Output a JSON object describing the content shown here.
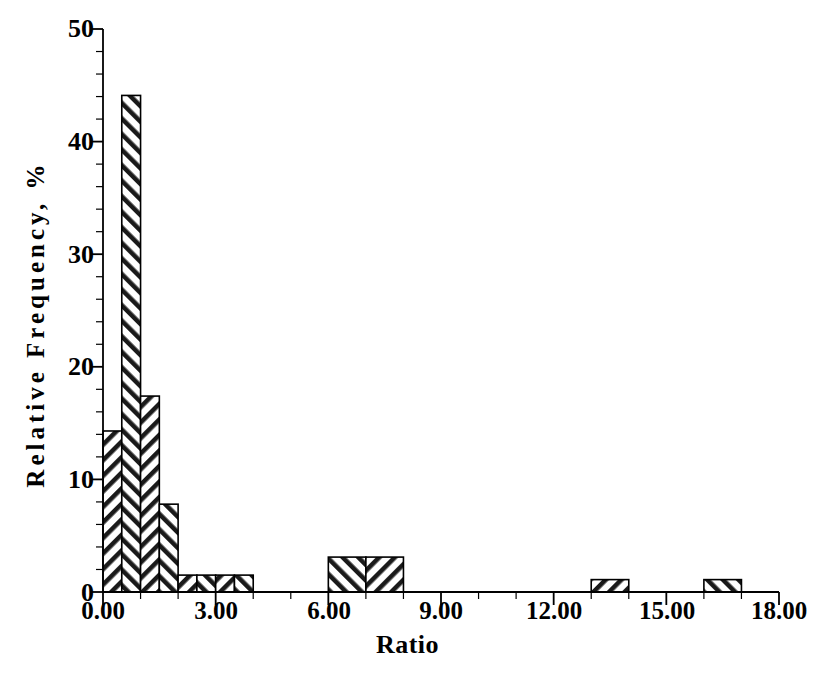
{
  "chart_data": {
    "type": "bar",
    "title": "",
    "subtitle": "",
    "xlabel": "Ratio",
    "ylabel": "Relative Frequency, %",
    "xlim": [
      0.0,
      18.0
    ],
    "ylim": [
      0,
      50
    ],
    "grid": false,
    "legend": null,
    "bin_width": 0.5,
    "x_major_ticks": [
      0.0,
      3.0,
      6.0,
      9.0,
      12.0,
      15.0,
      18.0
    ],
    "x_major_tick_labels": [
      "0.00",
      "3.00",
      "6.00",
      "9.00",
      "12.00",
      "15.00",
      "18.00"
    ],
    "x_minor_tick_step": 1.0,
    "y_major_ticks": [
      0,
      10,
      20,
      30,
      40,
      50
    ],
    "y_major_tick_labels": [
      "0",
      "10",
      "20",
      "30",
      "40",
      "50"
    ],
    "y_minor_tick_step": 2,
    "bars": [
      {
        "x_start": 0.0,
        "x_end": 0.5,
        "value": 14.3,
        "hatch": "forward"
      },
      {
        "x_start": 0.5,
        "x_end": 1.0,
        "value": 44.1,
        "hatch": "backward"
      },
      {
        "x_start": 1.0,
        "x_end": 1.5,
        "value": 17.4,
        "hatch": "forward"
      },
      {
        "x_start": 1.5,
        "x_end": 2.0,
        "value": 7.8,
        "hatch": "backward"
      },
      {
        "x_start": 2.0,
        "x_end": 2.5,
        "value": 1.5,
        "hatch": "forward"
      },
      {
        "x_start": 2.5,
        "x_end": 3.0,
        "value": 1.5,
        "hatch": "backward"
      },
      {
        "x_start": 3.0,
        "x_end": 3.5,
        "value": 1.5,
        "hatch": "forward"
      },
      {
        "x_start": 3.5,
        "x_end": 4.0,
        "value": 1.5,
        "hatch": "backward"
      },
      {
        "x_start": 6.0,
        "x_end": 7.0,
        "value": 3.1,
        "hatch": "backward"
      },
      {
        "x_start": 7.0,
        "x_end": 8.0,
        "value": 3.1,
        "hatch": "forward"
      },
      {
        "x_start": 13.0,
        "x_end": 14.0,
        "value": 1.1,
        "hatch": "forward"
      },
      {
        "x_start": 16.0,
        "x_end": 17.0,
        "value": 1.1,
        "hatch": "backward"
      }
    ],
    "categories": [
      "0.00-0.50",
      "0.50-1.00",
      "1.00-1.50",
      "1.50-2.00",
      "2.00-2.50",
      "2.50-3.00",
      "3.00-3.50",
      "3.50-4.00",
      "6.00-7.00",
      "7.00-8.00",
      "13.00-14.00",
      "16.00-17.00"
    ],
    "values": [
      14.3,
      44.1,
      17.4,
      7.8,
      1.5,
      1.5,
      1.5,
      1.5,
      3.1,
      3.1,
      1.1,
      1.1
    ]
  },
  "axes": {
    "ylabel": "Relative Frequency, %",
    "xlabel": "Ratio",
    "ytick_labels": [
      "50",
      "40",
      "30",
      "20",
      "10",
      "0"
    ],
    "xtick_labels": [
      "0.00",
      "3.00",
      "6.00",
      "9.00",
      "12.00",
      "15.00",
      "18.00"
    ]
  },
  "colors": {
    "axis": "#000000",
    "bar_outline": "#000000",
    "bar_fill": "#ffffff",
    "hatch": "#1a1a1a",
    "background": "#ffffff"
  },
  "caption": {
    "text": ""
  }
}
